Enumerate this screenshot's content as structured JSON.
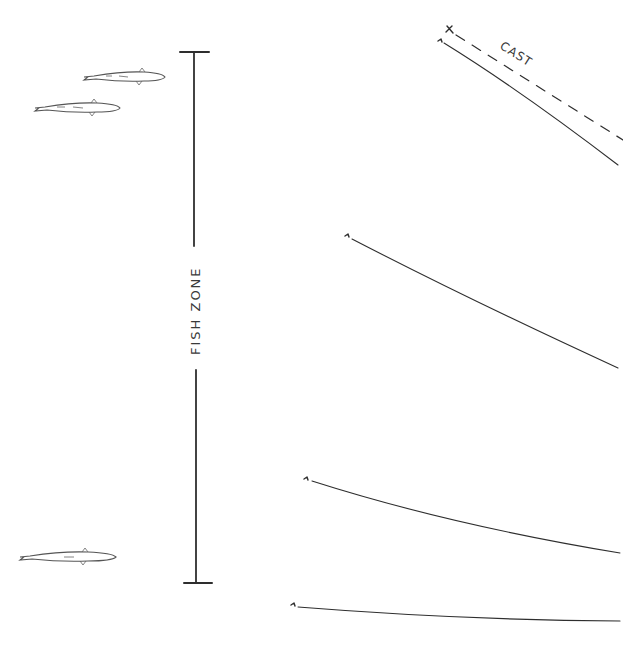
{
  "diagram": {
    "type": "fishing-depth-illustration",
    "background": "#ffffff",
    "ink_color": "#2e2e2e",
    "depth_marker": {
      "label": "FISH ZONE",
      "orientation": "vertical"
    },
    "cast": {
      "label": "CAST",
      "start_marker": "X",
      "style": "dashed"
    },
    "fish": [
      {
        "id": "fish-1",
        "position": "upper-right-of-pair"
      },
      {
        "id": "fish-2",
        "position": "upper-left-of-pair"
      },
      {
        "id": "fish-3",
        "position": "bottom"
      }
    ],
    "lines": [
      {
        "id": "line-1",
        "description": "steep line near surface with cast path"
      },
      {
        "id": "line-2",
        "description": "line sinking at mid depth"
      },
      {
        "id": "line-3",
        "description": "shallow-angle line at lower depth"
      },
      {
        "id": "line-4",
        "description": "nearly flat line at bottom"
      }
    ]
  }
}
